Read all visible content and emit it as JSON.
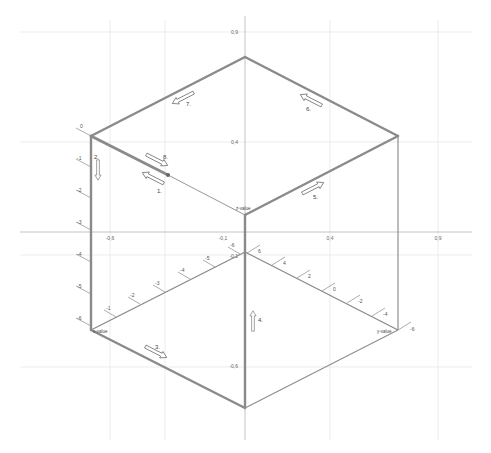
{
  "diagram": {
    "type": "isometric-cube-path",
    "background": "#ffffff",
    "colors": {
      "edge": "#8a8a8a",
      "thin_edge": "#9a9a9a",
      "grid": "#e2e2e2",
      "axis": "#b0b0b0",
      "tick": "#8a8a8a",
      "label": "#555555"
    },
    "plane_axes": {
      "x_ticks": [
        {
          "label": "-0,6",
          "x": 114,
          "y": 238
        },
        {
          "label": "-0,1",
          "x": 223,
          "y": 238
        },
        {
          "label": "0,4",
          "x": 330,
          "y": 238
        },
        {
          "label": "0,9",
          "x": 438,
          "y": 238
        }
      ],
      "y_ticks": [
        {
          "label": "0,9",
          "x": 234,
          "y": 33
        },
        {
          "label": "0,4",
          "x": 234,
          "y": 143
        },
        {
          "label": "-0,1",
          "x": 230,
          "y": 254
        },
        {
          "label": "-0,6",
          "x": 230,
          "y": 367
        }
      ]
    },
    "corner_labels": {
      "z_axis": "z-value",
      "x_axis": "x-value",
      "y_axis": "y-value"
    },
    "z_axis_ticks": [
      "0",
      "-1",
      "-2",
      "-3",
      "-4",
      "-5",
      "-6"
    ],
    "x_axis_ticks": [
      "-1",
      "-2",
      "-3",
      "-4",
      "-5",
      "-6"
    ],
    "y_axis_ticks": [
      "6",
      "4",
      "2",
      "0",
      "-2",
      "-4",
      "-6"
    ],
    "arrows": [
      {
        "label": "1.",
        "direction": "up-left"
      },
      {
        "label": "2.",
        "direction": "down"
      },
      {
        "label": "3.",
        "direction": "down-right"
      },
      {
        "label": "4.",
        "direction": "up"
      },
      {
        "label": "5.",
        "direction": "up-right"
      },
      {
        "label": "6.",
        "direction": "up-left"
      },
      {
        "label": "7.",
        "direction": "down-left"
      },
      {
        "label": "8.",
        "direction": "down-right"
      }
    ]
  }
}
